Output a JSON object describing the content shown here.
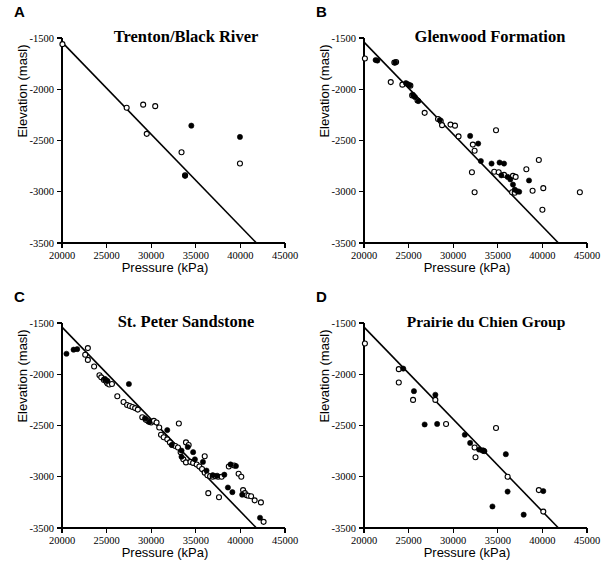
{
  "figure": {
    "panel_count": 4,
    "background": "#ffffff",
    "ink": "#000000"
  },
  "axes_common": {
    "xlabel": "Pressure (kPa)",
    "ylabel": "Elevation (masl)",
    "xlim": [
      20000,
      45000
    ],
    "ylim": [
      -3500,
      -1500
    ],
    "xticks": [
      20000,
      25000,
      30000,
      35000,
      40000,
      45000
    ],
    "xticklabels": [
      "20000",
      "25000",
      "30000",
      "35000",
      "40000",
      "45000"
    ],
    "yticks": [
      -1500,
      -2000,
      -2500,
      -3000,
      -3500
    ],
    "yticklabels": [
      "-1500",
      "-2000",
      "-2500",
      "-3000",
      "-3500"
    ],
    "grid": false,
    "legend": "none"
  },
  "chart_data": [
    {
      "type": "scatter",
      "panel": "A",
      "title": "Trenton/Black River",
      "xlabel": "Pressure (kPa)",
      "ylabel": "Elevation (masl)",
      "xlim": [
        20000,
        45000
      ],
      "ylim": [
        -3500,
        -1500
      ],
      "grid": false,
      "trendline": {
        "x": [
          20000,
          41800
        ],
        "y": [
          -1540,
          -3500
        ]
      },
      "series": [
        {
          "name": "open-circles",
          "marker": "open",
          "points": [
            [
              20050,
              -1560
            ],
            [
              27250,
              -2180
            ],
            [
              29100,
              -2150
            ],
            [
              30450,
              -2165
            ],
            [
              29500,
              -2435
            ],
            [
              33400,
              -2615
            ],
            [
              33800,
              -2840
            ],
            [
              39950,
              -2725
            ]
          ]
        },
        {
          "name": "filled-circles",
          "marker": "filled",
          "points": [
            [
              34500,
              -2355
            ],
            [
              33800,
              -2845
            ],
            [
              39950,
              -2465
            ]
          ]
        }
      ]
    },
    {
      "type": "scatter",
      "panel": "B",
      "title": "Glenwood Formation",
      "xlabel": "Pressure (kPa)",
      "ylabel": "Elevation (masl)",
      "xlim": [
        20000,
        45000
      ],
      "ylim": [
        -3500,
        -1500
      ],
      "grid": false,
      "trendline": {
        "x": [
          20000,
          41800
        ],
        "y": [
          -1540,
          -3500
        ]
      },
      "series": [
        {
          "name": "open-circles",
          "marker": "open",
          "points": [
            [
              20100,
              -1700
            ],
            [
              23400,
              -1740
            ],
            [
              23600,
              -1735
            ],
            [
              23000,
              -1930
            ],
            [
              24300,
              -1955
            ],
            [
              25200,
              -1965
            ],
            [
              25400,
              -2060
            ],
            [
              26000,
              -2110
            ],
            [
              26800,
              -2230
            ],
            [
              28300,
              -2290
            ],
            [
              28600,
              -2310
            ],
            [
              28750,
              -2350
            ],
            [
              29700,
              -2345
            ],
            [
              30200,
              -2355
            ],
            [
              30600,
              -2460
            ],
            [
              32200,
              -2540
            ],
            [
              32400,
              -2600
            ],
            [
              32100,
              -2810
            ],
            [
              32400,
              -3005
            ],
            [
              34800,
              -2400
            ],
            [
              34600,
              -2805
            ],
            [
              35100,
              -2810
            ],
            [
              35700,
              -2835
            ],
            [
              36700,
              -2845
            ],
            [
              37000,
              -2855
            ],
            [
              38200,
              -2780
            ],
            [
              38900,
              -2990
            ],
            [
              39600,
              -2690
            ],
            [
              40100,
              -2965
            ],
            [
              40000,
              -3175
            ],
            [
              44200,
              -3005
            ],
            [
              36600,
              -3005
            ],
            [
              36900,
              -3010
            ]
          ]
        },
        {
          "name": "filled-circles",
          "marker": "filled",
          "points": [
            [
              21300,
              -1715
            ],
            [
              21500,
              -1720
            ],
            [
              23500,
              -1740
            ],
            [
              24700,
              -1940
            ],
            [
              24900,
              -1950
            ],
            [
              25100,
              -1960
            ],
            [
              25500,
              -2055
            ],
            [
              25700,
              -2075
            ],
            [
              26100,
              -2115
            ],
            [
              28500,
              -2300
            ],
            [
              31900,
              -2455
            ],
            [
              32800,
              -2530
            ],
            [
              33100,
              -2700
            ],
            [
              34300,
              -2725
            ],
            [
              35200,
              -2715
            ],
            [
              35700,
              -2725
            ],
            [
              35400,
              -2840
            ],
            [
              36100,
              -2855
            ],
            [
              36400,
              -2880
            ],
            [
              36700,
              -2930
            ],
            [
              36900,
              -2980
            ],
            [
              37200,
              -2995
            ],
            [
              37400,
              -3000
            ],
            [
              38500,
              -2890
            ]
          ]
        }
      ]
    },
    {
      "type": "scatter",
      "panel": "C",
      "title": "St. Peter Sandstone",
      "xlabel": "Pressure (kPa)",
      "ylabel": "Elevation (masl)",
      "xlim": [
        20000,
        45000
      ],
      "ylim": [
        -3500,
        -1500
      ],
      "grid": false,
      "trendline": {
        "x": [
          20000,
          41800
        ],
        "y": [
          -1540,
          -3500
        ]
      },
      "series": [
        {
          "name": "open-circles",
          "marker": "open",
          "points": [
            [
              22900,
              -1745
            ],
            [
              22600,
              -1810
            ],
            [
              22900,
              -1860
            ],
            [
              23600,
              -1925
            ],
            [
              24200,
              -2010
            ],
            [
              24400,
              -2030
            ],
            [
              24700,
              -2055
            ],
            [
              24900,
              -2060
            ],
            [
              25000,
              -2075
            ],
            [
              25100,
              -2090
            ],
            [
              25300,
              -2100
            ],
            [
              25600,
              -2095
            ],
            [
              26200,
              -2215
            ],
            [
              26900,
              -2270
            ],
            [
              27300,
              -2300
            ],
            [
              27600,
              -2310
            ],
            [
              27900,
              -2320
            ],
            [
              28200,
              -2330
            ],
            [
              28500,
              -2345
            ],
            [
              29000,
              -2420
            ],
            [
              29400,
              -2445
            ],
            [
              29700,
              -2460
            ],
            [
              30000,
              -2470
            ],
            [
              30300,
              -2455
            ],
            [
              30600,
              -2470
            ],
            [
              30900,
              -2520
            ],
            [
              31100,
              -2590
            ],
            [
              31400,
              -2615
            ],
            [
              31800,
              -2635
            ],
            [
              32100,
              -2665
            ],
            [
              32400,
              -2690
            ],
            [
              32700,
              -2700
            ],
            [
              33000,
              -2715
            ],
            [
              33300,
              -2760
            ],
            [
              33100,
              -2480
            ],
            [
              33900,
              -2665
            ],
            [
              34200,
              -2690
            ],
            [
              33600,
              -2830
            ],
            [
              33900,
              -2860
            ],
            [
              34400,
              -2855
            ],
            [
              34700,
              -2865
            ],
            [
              35100,
              -2880
            ],
            [
              35400,
              -2900
            ],
            [
              35700,
              -2925
            ],
            [
              36000,
              -2960
            ],
            [
              36300,
              -2985
            ],
            [
              36000,
              -2800
            ],
            [
              36600,
              -2995
            ],
            [
              36900,
              -3000
            ],
            [
              37200,
              -2995
            ],
            [
              37500,
              -3000
            ],
            [
              37900,
              -3000
            ],
            [
              38700,
              -2900
            ],
            [
              39300,
              -2890
            ],
            [
              39800,
              -2970
            ],
            [
              40100,
              -3000
            ],
            [
              40300,
              -3130
            ],
            [
              40500,
              -3160
            ],
            [
              40700,
              -3180
            ],
            [
              40900,
              -3185
            ],
            [
              41200,
              -3190
            ],
            [
              41600,
              -3230
            ],
            [
              42300,
              -3250
            ],
            [
              36400,
              -3160
            ],
            [
              37600,
              -3200
            ],
            [
              42600,
              -3440
            ]
          ]
        },
        {
          "name": "filled-circles",
          "marker": "filled",
          "points": [
            [
              20500,
              -1800
            ],
            [
              21300,
              -1760
            ],
            [
              21700,
              -1755
            ],
            [
              24800,
              -2045
            ],
            [
              25100,
              -2065
            ],
            [
              27500,
              -2095
            ],
            [
              29300,
              -2430
            ],
            [
              29800,
              -2465
            ],
            [
              31800,
              -2545
            ],
            [
              32300,
              -2690
            ],
            [
              33400,
              -2745
            ],
            [
              34100,
              -2710
            ],
            [
              34700,
              -2760
            ],
            [
              33400,
              -2805
            ],
            [
              34900,
              -2830
            ],
            [
              35800,
              -2855
            ],
            [
              36200,
              -2940
            ],
            [
              36900,
              -2985
            ],
            [
              37400,
              -2990
            ],
            [
              38200,
              -2980
            ],
            [
              38900,
              -2880
            ],
            [
              39500,
              -2895
            ],
            [
              38600,
              -3105
            ],
            [
              39100,
              -3150
            ],
            [
              40200,
              -3175
            ],
            [
              42200,
              -3400
            ]
          ]
        }
      ]
    },
    {
      "type": "scatter",
      "panel": "D",
      "title": "Prairie du Chien Group",
      "xlabel": "Pressure (kPa)",
      "ylabel": "Elevation (masl)",
      "xlim": [
        20000,
        45000
      ],
      "ylim": [
        -3500,
        -1500
      ],
      "grid": false,
      "trendline": {
        "x": [
          20000,
          41800
        ],
        "y": [
          -1540,
          -3500
        ]
      },
      "series": [
        {
          "name": "open-circles",
          "marker": "open",
          "points": [
            [
              20100,
              -1700
            ],
            [
              23900,
              -1950
            ],
            [
              23900,
              -2080
            ],
            [
              25500,
              -2250
            ],
            [
              28000,
              -2250
            ],
            [
              29200,
              -2485
            ],
            [
              32400,
              -2715
            ],
            [
              32500,
              -2810
            ],
            [
              33300,
              -2745
            ],
            [
              34800,
              -2525
            ],
            [
              36100,
              -3000
            ],
            [
              39600,
              -3130
            ],
            [
              40100,
              -3340
            ]
          ]
        },
        {
          "name": "filled-circles",
          "marker": "filled",
          "points": [
            [
              24400,
              -1945
            ],
            [
              25600,
              -2165
            ],
            [
              26800,
              -2490
            ],
            [
              28000,
              -2200
            ],
            [
              28200,
              -2485
            ],
            [
              31300,
              -2590
            ],
            [
              31900,
              -2670
            ],
            [
              32900,
              -2735
            ],
            [
              33400,
              -2745
            ],
            [
              33500,
              -2750
            ],
            [
              35900,
              -2780
            ],
            [
              36100,
              -3145
            ],
            [
              34400,
              -3290
            ],
            [
              37900,
              -3370
            ],
            [
              40100,
              -3140
            ]
          ]
        }
      ]
    }
  ],
  "panels": [
    {
      "letter": "A",
      "title": "Trenton/Black River",
      "xlabel": "Pressure (kPa)",
      "ylabel": "Elevation (masl)"
    },
    {
      "letter": "B",
      "title": "Glenwood Formation",
      "xlabel": "Pressure (kPa)",
      "ylabel": "Elevation (masl)"
    },
    {
      "letter": "C",
      "title": "St. Peter Sandstone",
      "xlabel": "Pressure (kPa)",
      "ylabel": "Elevation (masl)"
    },
    {
      "letter": "D",
      "title": "Prairie du Chien Group",
      "xlabel": "Pressure (kPa)",
      "ylabel": "Elevation (masl)"
    }
  ]
}
